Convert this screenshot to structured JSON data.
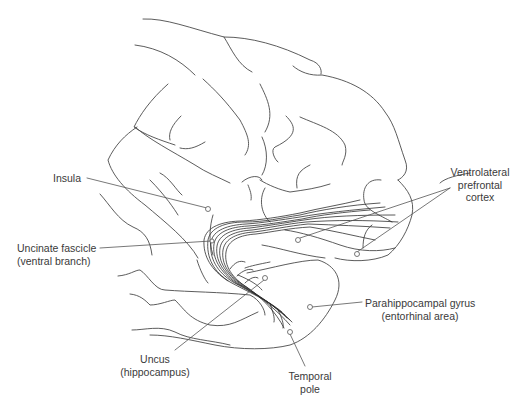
{
  "figure": {
    "line_color": "#4a4a4a",
    "background": "#ffffff"
  },
  "labels": {
    "insula": {
      "line1": "Insula"
    },
    "uncinate": {
      "line1": "Uncinate fascicle",
      "line2": "(ventral branch)"
    },
    "vlpfc": {
      "line1": "Ventrolateral",
      "line2": "prefrontal",
      "line3": "cortex"
    },
    "parahippocampal": {
      "line1": "Parahippocampal gyrus",
      "line2": "(entorhinal area)"
    },
    "uncus": {
      "line1": "Uncus",
      "line2": "(hippocampus)"
    },
    "temporal_pole": {
      "line1": "Temporal",
      "line2": "pole"
    }
  }
}
